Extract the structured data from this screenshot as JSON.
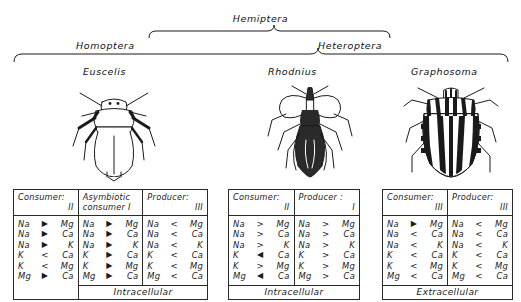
{
  "taxonomy": {
    "top": "Hemiptera",
    "left": "Homoptera",
    "right": "Heteroptera"
  },
  "species": [
    {
      "name": "Euscelis",
      "icon": "leafhopper-illustration"
    },
    {
      "name": "Rhodnius",
      "icon": "assassin-bug-illustration"
    },
    {
      "name": "Graphosoma",
      "icon": "shield-bug-illustration"
    }
  ],
  "tables": [
    {
      "id": "table-1",
      "footer": "Intracellular",
      "footer_span": "cols-2-3",
      "columns": [
        {
          "head_line1": "Consumer:",
          "head_line2": "II",
          "two_line_left": false,
          "rows": [
            {
              "a": "Na",
              "op": "▶",
              "b": "Mg"
            },
            {
              "a": "Na",
              "op": "▶",
              "b": "Ca"
            },
            {
              "a": "Na",
              "op": "▶",
              "b": "K"
            },
            {
              "a": "K",
              "op": "<",
              "b": "Ca"
            },
            {
              "a": "K",
              "op": "<",
              "b": "Mg"
            },
            {
              "a": "Mg",
              "op": "▶",
              "b": "Ca"
            }
          ]
        },
        {
          "head_line1": "Asymbiotic",
          "head_line2": "consumer I",
          "two_line_left": true,
          "rows": [
            {
              "a": "Na",
              "op": "▶",
              "b": "Mg"
            },
            {
              "a": "Na",
              "op": "▶",
              "b": "Ca"
            },
            {
              "a": "Na",
              "op": "▶",
              "b": "K"
            },
            {
              "a": "K",
              "op": "▶",
              "b": "Ca"
            },
            {
              "a": "K",
              "op": "▶",
              "b": "Mg"
            },
            {
              "a": "Mg",
              "op": "▶",
              "b": "Ca"
            }
          ]
        },
        {
          "head_line1": "Producer:",
          "head_line2": "III",
          "two_line_left": false,
          "rows": [
            {
              "a": "Na",
              "op": "<",
              "b": "Mg"
            },
            {
              "a": "Na",
              "op": "<",
              "b": "Ca"
            },
            {
              "a": "Na",
              "op": "<",
              "b": "K"
            },
            {
              "a": "K",
              "op": "<",
              "b": "Ca"
            },
            {
              "a": "K",
              "op": "<",
              "b": "Mg"
            },
            {
              "a": "Mg",
              "op": "<",
              "b": "Ca"
            }
          ]
        }
      ]
    },
    {
      "id": "table-2",
      "footer": "Intracellular",
      "footer_span": "full",
      "columns": [
        {
          "head_line1": "Consumer:",
          "head_line2": "II",
          "two_line_left": false,
          "rows": [
            {
              "a": "Na",
              "op": ">",
              "b": "Mg"
            },
            {
              "a": "Na",
              "op": ">",
              "b": "Ca"
            },
            {
              "a": "Na",
              "op": ">",
              "b": "K"
            },
            {
              "a": "K",
              "op": "◀",
              "b": "Ca"
            },
            {
              "a": "K",
              "op": ">",
              "b": "Mg"
            },
            {
              "a": "Mg",
              "op": "◀",
              "b": "Ca"
            }
          ]
        },
        {
          "head_line1": "Producer :",
          "head_line2": "I",
          "two_line_left": false,
          "rows": [
            {
              "a": "Na",
              "op": ">",
              "b": "Mg"
            },
            {
              "a": "Na",
              "op": ">",
              "b": "Ca"
            },
            {
              "a": "Na",
              "op": ">",
              "b": "K"
            },
            {
              "a": "K",
              "op": ">",
              "b": "Ca"
            },
            {
              "a": "K",
              "op": ">",
              "b": "Mg"
            },
            {
              "a": "Mg",
              "op": ">",
              "b": "Ca"
            }
          ]
        }
      ]
    },
    {
      "id": "table-3",
      "footer": "Extracellular",
      "footer_span": "full",
      "columns": [
        {
          "head_line1": "Consumer:",
          "head_line2": "III",
          "two_line_left": false,
          "rows": [
            {
              "a": "Na",
              "op": "▶",
              "b": "Mg"
            },
            {
              "a": "Na",
              "op": "<",
              "b": "Ca"
            },
            {
              "a": "Na",
              "op": "<",
              "b": "K"
            },
            {
              "a": "K",
              "op": "<",
              "b": "Ca"
            },
            {
              "a": "K",
              "op": "<",
              "b": "Mg"
            },
            {
              "a": "Mg",
              "op": "<",
              "b": "Ca"
            }
          ]
        },
        {
          "head_line1": "Producer:",
          "head_line2": "III",
          "two_line_left": false,
          "rows": [
            {
              "a": "Na",
              "op": "<",
              "b": "Mg"
            },
            {
              "a": "Na",
              "op": "<",
              "b": "Ca"
            },
            {
              "a": "Na",
              "op": "<",
              "b": "K"
            },
            {
              "a": "K",
              "op": "<",
              "b": "Ca"
            },
            {
              "a": "K",
              "op": "<",
              "b": "Mg"
            },
            {
              "a": "Mg",
              "op": "<",
              "b": "Ca"
            }
          ]
        }
      ]
    }
  ]
}
